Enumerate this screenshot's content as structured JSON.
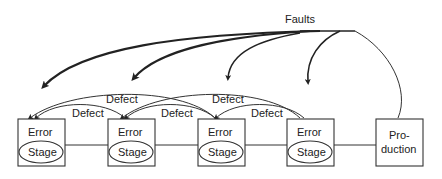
{
  "diagram": {
    "title_label": "Faults",
    "stages": [
      {
        "top": "Error",
        "bottom": "Stage"
      },
      {
        "top": "Error",
        "bottom": "Stage"
      },
      {
        "top": "Error",
        "bottom": "Stage"
      },
      {
        "top": "Error",
        "bottom": "Stage"
      }
    ],
    "production": {
      "line1": "Pro-",
      "line2": "duction"
    },
    "defect_labels": [
      "Defect",
      "Defect",
      "Defect",
      "Defect",
      "Defect"
    ],
    "colors": {
      "stroke": "#333333",
      "background": "#ffffff"
    }
  }
}
